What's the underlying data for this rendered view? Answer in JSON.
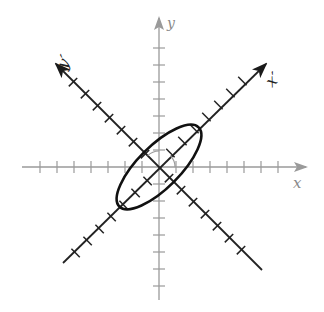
{
  "diagram": {
    "type": "rotated-axes-ellipse",
    "center": [
      159,
      167
    ],
    "axes": {
      "x": {
        "label": "x",
        "color": "#9a9a9a"
      },
      "y": {
        "label": "y",
        "color": "#9a9a9a"
      },
      "x_prime": {
        "label": "x′",
        "color": "#222222",
        "rotation_deg": 45
      },
      "y_prime": {
        "label": "y′",
        "color": "#222222",
        "rotation_deg": 135
      }
    },
    "ellipse": {
      "major_axis_along": "x′",
      "stroke_color": "#111111"
    },
    "rotation_arc": {
      "present": true
    }
  }
}
